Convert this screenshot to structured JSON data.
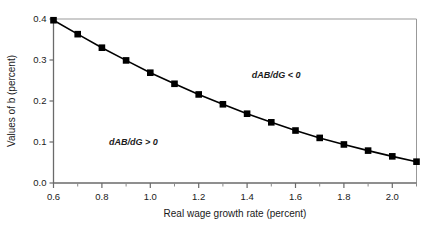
{
  "chart_data": {
    "type": "line",
    "title": "",
    "xlabel": "Real wage growth rate (percent)",
    "ylabel": "Values of b (percent)",
    "xlim": [
      0.6,
      2.1
    ],
    "ylim": [
      0.0,
      0.4
    ],
    "grid": false,
    "legend": null,
    "marker": "filled-square",
    "line_color": "#000000",
    "marker_color": "#000000",
    "frame_color": "#999999",
    "xticks": [
      0.6,
      0.8,
      1.0,
      1.2,
      1.4,
      1.6,
      1.8,
      2.0
    ],
    "xtick_labels": [
      "0.6",
      "0.8",
      "1.0",
      "1.2",
      "1.4",
      "1.6",
      "1.8",
      "2.0"
    ],
    "xminor_ticks": [
      0.7,
      0.9,
      1.1,
      1.3,
      1.5,
      1.7,
      1.9,
      2.1
    ],
    "yticks": [
      0.0,
      0.1,
      0.2,
      0.3,
      0.4
    ],
    "ytick_labels": [
      "0.0",
      "0.1",
      "0.2",
      "0.3",
      "0.4"
    ],
    "x": [
      0.6,
      0.7,
      0.8,
      0.9,
      1.0,
      1.1,
      1.2,
      1.3,
      1.4,
      1.5,
      1.6,
      1.7,
      1.8,
      1.9,
      2.0,
      2.1
    ],
    "values": [
      0.397,
      0.363,
      0.33,
      0.299,
      0.269,
      0.242,
      0.216,
      0.192,
      0.169,
      0.148,
      0.128,
      0.11,
      0.094,
      0.079,
      0.065,
      0.052
    ],
    "annotations": [
      {
        "text": "dAB/dG < 0",
        "x": 1.52,
        "y": 0.255
      },
      {
        "text": "dAB/dG > 0",
        "x": 0.93,
        "y": 0.093
      }
    ]
  }
}
